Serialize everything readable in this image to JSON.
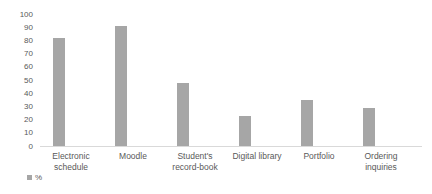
{
  "chart_data": {
    "type": "bar",
    "categories": [
      "Electronic\nschedule",
      "Moodle",
      "Student's\nrecord-book",
      "Digital library",
      "Portfolio",
      "Ordering\ninquiries"
    ],
    "values": [
      82,
      91,
      48,
      23,
      35,
      29
    ],
    "title": "",
    "xlabel": "",
    "ylabel": "",
    "ylim": [
      0,
      100
    ],
    "yticks": [
      0,
      10,
      20,
      30,
      40,
      50,
      60,
      70,
      80,
      90,
      100
    ],
    "grid": false,
    "legend": {
      "position": "bottom-left",
      "entries": [
        {
          "label": "%",
          "color": "#a6a6a6"
        }
      ]
    },
    "colors": {
      "bar": "#a6a6a6",
      "axis_line": "#d9d9d9",
      "text": "#595959",
      "background": "#ffffff"
    }
  }
}
